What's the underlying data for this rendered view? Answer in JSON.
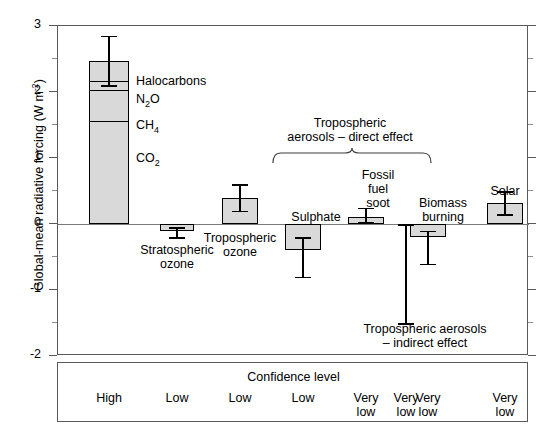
{
  "chart_data": {
    "type": "bar",
    "title": "",
    "xlabel": "",
    "ylabel": "Global-mean radiative forcing (W m",
    "ylabel_sup": "-2",
    "ylabel_tail": ")",
    "ylim": [
      -2,
      3
    ],
    "ytick_labels": [
      "3",
      "2",
      "1",
      "0",
      "-1",
      "-2"
    ],
    "ytick_values": [
      3,
      2,
      1,
      0,
      -1,
      -2
    ],
    "yminor_values": [
      2.5,
      1.5,
      0.5,
      -0.5,
      -1.5
    ],
    "grid": false,
    "legend": "none",
    "zero_reference_line": true,
    "categories": [
      "Greenhouse gases",
      "Stratospheric ozone",
      "Tropospheric ozone",
      "Sulphate",
      "Fossil fuel soot",
      "Biomass burning",
      "Tropospheric aerosols - indirect effect",
      "Solar"
    ],
    "values": [
      2.47,
      -0.1,
      0.4,
      -0.4,
      0.1,
      -0.2,
      null,
      0.32
    ],
    "series": [
      {
        "name": "Greenhouse gases (stacked)",
        "stacked_segments": [
          {
            "label": "CO2",
            "label_text": "CO",
            "label_sub": "2",
            "from": 0.0,
            "to": 1.56
          },
          {
            "label": "CH4",
            "label_text": "CH",
            "label_sub": "4",
            "from": 1.56,
            "to": 2.03
          },
          {
            "label": "N2O",
            "label_text": "N",
            "label_sub": "2",
            "label_tail": "O",
            "from": 2.03,
            "to": 2.17
          },
          {
            "label": "Halocarbons",
            "label_text": "Halocarbons",
            "from": 2.17,
            "to": 2.47
          }
        ]
      }
    ],
    "bars": [
      {
        "name": "greenhouse-gases",
        "label": "",
        "value": 2.47,
        "err_low": 2.1,
        "err_high": 2.85,
        "stacked": true
      },
      {
        "name": "stratospheric-ozone",
        "label": "Stratospheric ozone",
        "value": -0.1,
        "err_low": -0.2,
        "err_high": -0.05
      },
      {
        "name": "tropospheric-ozone",
        "label": "Tropospheric ozone",
        "value": 0.4,
        "err_low": 0.2,
        "err_high": 0.6
      },
      {
        "name": "sulphate",
        "label": "Sulphate",
        "value": -0.4,
        "err_low": -0.8,
        "err_high": -0.2
      },
      {
        "name": "fossil-fuel-soot",
        "label": "Fossil fuel soot",
        "value": 0.1,
        "err_low": 0.03,
        "err_high": 0.25
      },
      {
        "name": "biomass-burning",
        "label": "Biomass burning",
        "value": -0.2,
        "err_low": -0.6,
        "err_high": -0.1
      },
      {
        "name": "tropospheric-aerosols-indirect",
        "label": "Tropospheric aerosols - indirect effect",
        "value": null,
        "err_low": -1.5,
        "err_high": 0.0,
        "bar_drawn": false
      },
      {
        "name": "solar",
        "label": "Solar",
        "value": 0.32,
        "err_low": 0.15,
        "err_high": 0.5
      }
    ],
    "annotations": {
      "brace_label_line1": "Tropospheric",
      "brace_label_line2": "aerosols – direct effect",
      "indirect_label_line1": "Tropospheric aerosols",
      "indirect_label_line2": "– indirect effect"
    },
    "bar_labels": {
      "halocarbons": "Halocarbons",
      "n2o_text": "N",
      "n2o_sub": "2",
      "n2o_tail": "O",
      "ch4_text": "CH",
      "ch4_sub": "4",
      "co2_text": "CO",
      "co2_sub": "2",
      "stratospheric_l1": "Stratospheric",
      "stratospheric_l2": "ozone",
      "tropospheric_o3_l1": "Tropospheric",
      "tropospheric_o3_l2": "ozone",
      "sulphate": "Sulphate",
      "soot_l1": "Fossil",
      "soot_l2": "fuel",
      "soot_l3": "soot",
      "biomass_l1": "Biomass",
      "biomass_l2": "burning",
      "solar": "Solar"
    }
  },
  "confidence": {
    "title": "Confidence level",
    "levels": [
      {
        "line1": "High",
        "line2": ""
      },
      {
        "line1": "Low",
        "line2": ""
      },
      {
        "line1": "Low",
        "line2": ""
      },
      {
        "line1": "Low",
        "line2": ""
      },
      {
        "line1": "Very",
        "line2": "low"
      },
      {
        "line1": "Very",
        "line2": "low"
      },
      {
        "line1": "Very",
        "line2": "low"
      },
      {
        "line1": "Very",
        "line2": "low"
      }
    ]
  },
  "colors": {
    "bar_fill": "#d9d9d9",
    "bar_stroke": "#000000",
    "frame": "#5a5a5a",
    "background": "#ffffff"
  }
}
